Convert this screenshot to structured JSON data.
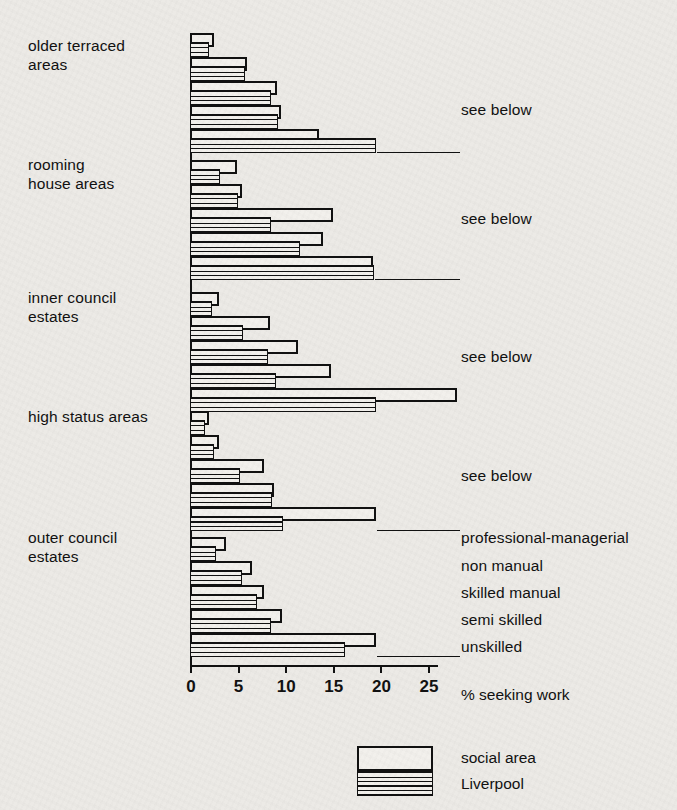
{
  "chart_data": {
    "type": "bar",
    "orientation": "horizontal",
    "title": "",
    "xlabel": "% seeking work",
    "ylabel": "",
    "xlim": [
      0,
      25
    ],
    "xticks": [
      0,
      5,
      10,
      15,
      20,
      25
    ],
    "xtick_labels": [
      "0",
      "5",
      "10",
      "15",
      "20",
      "25"
    ],
    "grid": false,
    "legend_position": "bottom-right",
    "categories": [
      "older terraced areas",
      "rooming house areas",
      "inner council estates",
      "high status areas",
      "outer council estates"
    ],
    "subcategories": [
      "professional-managerial",
      "non manual",
      "skilled manual",
      "semi skilled",
      "unskilled"
    ],
    "series": [
      {
        "name": "social area",
        "groups": [
          {
            "category": "older terraced areas",
            "values": [
              2.5,
              6.0,
              9.1,
              9.6,
              13.5
            ]
          },
          {
            "category": "rooming house areas",
            "values": [
              4.9,
              5.5,
              15.0,
              14.0,
              19.2
            ]
          },
          {
            "category": "inner council estates",
            "values": [
              3.0,
              8.4,
              11.3,
              14.8,
              28.0
            ]
          },
          {
            "category": "high status areas",
            "values": [
              2.0,
              3.0,
              7.8,
              8.8,
              19.5
            ]
          },
          {
            "category": "outer council estates",
            "values": [
              3.8,
              6.5,
              7.8,
              9.7,
              19.5
            ]
          }
        ]
      },
      {
        "name": "Liverpool",
        "groups": [
          {
            "category": "older terraced areas",
            "values": [
              2.0,
              5.8,
              8.5,
              9.2,
              19.5
            ]
          },
          {
            "category": "rooming house areas",
            "values": [
              3.1,
              5.0,
              8.5,
              11.6,
              19.3
            ]
          },
          {
            "category": "inner council estates",
            "values": [
              2.3,
              5.6,
              8.2,
              9.0,
              19.5
            ]
          },
          {
            "category": "high status areas",
            "values": [
              1.6,
              2.5,
              5.2,
              8.6,
              9.8
            ]
          },
          {
            "category": "outer council estates",
            "values": [
              2.7,
              5.5,
              7.0,
              8.5,
              16.3
            ]
          }
        ]
      }
    ],
    "annotations": [
      {
        "text": "see below",
        "group": "older terraced areas"
      },
      {
        "text": "see below",
        "group": "rooming house areas"
      },
      {
        "text": "see below",
        "group": "inner council estates"
      },
      {
        "text": "see below",
        "group": "high status areas"
      }
    ]
  },
  "axis": {
    "x_title": "% seeking work",
    "tick_labels": [
      "0",
      "5",
      "10",
      "15",
      "20",
      "25"
    ]
  },
  "category_labels": [
    "older terraced\nareas",
    "rooming\nhouse areas",
    "inner council\nestates",
    "high status areas",
    "outer council\nestates"
  ],
  "annotations": {
    "see_below": "see below"
  },
  "class_labels": [
    "professional-managerial",
    "non manual",
    "skilled manual",
    "semi skilled",
    "unskilled"
  ],
  "legend": {
    "items": [
      {
        "label": "social area",
        "pattern": "outline"
      },
      {
        "label": "Liverpool",
        "pattern": "horizontal-hatch"
      }
    ]
  },
  "colors": {
    "ink": "#111111",
    "paper": "#eceae6",
    "fill": "#f2f0ec"
  }
}
